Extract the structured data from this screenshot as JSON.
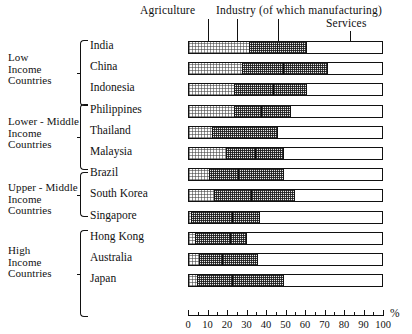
{
  "chart_data": {
    "type": "bar",
    "orientation": "horizontal",
    "stacked": true,
    "title": "",
    "xlabel": "%",
    "ylabel": "",
    "xlim": [
      0,
      100
    ],
    "grid": false,
    "legend_position": "top-annotations",
    "axis_unit": "%",
    "tick_labels": [
      "0",
      "10",
      "20",
      "30",
      "40",
      "50",
      "60",
      "70",
      "80",
      "90",
      "100"
    ],
    "tick_values": [
      0,
      10,
      20,
      30,
      40,
      50,
      60,
      70,
      80,
      90,
      100
    ],
    "minor_tick_step": 5,
    "annotations": [
      {
        "text": "Agriculture",
        "points_to_percent": 10
      },
      {
        "text": "Industry (of which manufacturing)",
        "points_to_percent": 25
      },
      {
        "text": "Services",
        "points_to_percent": 83
      }
    ],
    "annotation_leaders": [
      {
        "name": "agriculture-leader",
        "percent": 10
      },
      {
        "name": "industry-leader",
        "percent": 25
      },
      {
        "name": "manufacturing-leader",
        "percent": 46
      },
      {
        "name": "services-leader",
        "percent": 83
      }
    ],
    "series": [
      {
        "name": "Agriculture",
        "values": [
          31,
          27,
          23,
          23,
          12,
          19,
          10,
          13,
          1,
          3,
          5,
          4
        ]
      },
      {
        "name": "Industry",
        "values": [
          29,
          44,
          37,
          29,
          33,
          29,
          38,
          41,
          35,
          26,
          30,
          44
        ]
      },
      {
        "name": "Services",
        "values": [
          40,
          29,
          40,
          48,
          55,
          52,
          52,
          46,
          64,
          71,
          65,
          52
        ]
      }
    ],
    "manufacturing_marker_percent": [
      45,
      48,
      43,
      37,
      28,
      34,
      25,
      32,
      22,
      21,
      17,
      22
    ],
    "categories": [
      "India",
      "China",
      "Indonesia",
      "Philippines",
      "Thailand",
      "Malaysia",
      "Brazil",
      "South Korea",
      "Singapore",
      "Hong Kong",
      "Australia",
      "Japan"
    ],
    "groups": [
      {
        "label": "Low\nIncome\nCountries",
        "countries": [
          "India",
          "China",
          "Indonesia"
        ]
      },
      {
        "label": "Lower - Middle\nIncome\nCountries",
        "countries": [
          "Philippines",
          "Thailand",
          "Malaysia"
        ]
      },
      {
        "label": "Upper - Middle\nIncome\nCountries",
        "countries": [
          "Brazil",
          "South Korea"
        ]
      },
      {
        "label": "High\nIncome\nCountries",
        "countries": [
          "Singapore",
          "Hong Kong",
          "Australia",
          "Japan"
        ]
      }
    ]
  }
}
